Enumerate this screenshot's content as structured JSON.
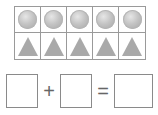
{
  "ten_frame": {
    "columns": 5,
    "rows": [
      {
        "shape": "circle",
        "count": 5
      },
      {
        "shape": "triangle",
        "count": 5
      }
    ],
    "border_color": "#9a9a9a",
    "shape_color": "#b0b0b0"
  },
  "equation": {
    "box1": "",
    "operator1": "+",
    "box2": "",
    "operator2": "=",
    "box3": ""
  }
}
